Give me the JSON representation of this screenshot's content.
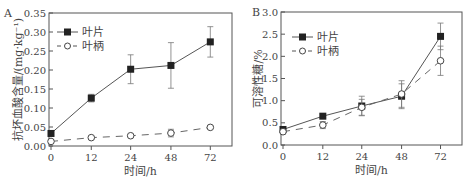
{
  "chart_data": [
    {
      "type": "line",
      "panel": "A",
      "title": "",
      "xlabel": "时间/h",
      "ylabel": "抗坏血酸含量/(mg·kg⁻¹)",
      "categories": [
        "0",
        "12",
        "24",
        "48",
        "72"
      ],
      "ylim": [
        0,
        0.35
      ],
      "yticks": [
        "0.00",
        "0.05",
        "0.10",
        "0.15",
        "0.20",
        "0.25",
        "0.30",
        "0.35"
      ],
      "legend_position": "upper-left",
      "series": [
        {
          "name": "叶片",
          "style": "solid-filled-square",
          "values": [
            0.033,
            0.126,
            0.202,
            0.212,
            0.274
          ],
          "errors": [
            0.004,
            0.01,
            0.038,
            0.06,
            0.04
          ]
        },
        {
          "name": "叶柄",
          "style": "dashed-open-circle",
          "values": [
            0.012,
            0.022,
            0.027,
            0.034,
            0.049
          ],
          "errors": [
            0.003,
            0.003,
            0.003,
            0.01,
            0.003
          ]
        }
      ]
    },
    {
      "type": "line",
      "panel": "B",
      "title": "",
      "xlabel": "时间/h",
      "ylabel": "可溶性糖/%",
      "categories": [
        "0",
        "12",
        "24",
        "48",
        "72"
      ],
      "ylim": [
        0,
        3.0
      ],
      "yticks": [
        "0.0",
        "0.5",
        "1.0",
        "1.5",
        "2.0",
        "2.5",
        "3.0"
      ],
      "legend_position": "upper-left",
      "series": [
        {
          "name": "叶片",
          "style": "solid-filled-square",
          "values": [
            0.35,
            0.65,
            0.88,
            1.1,
            2.45
          ],
          "errors": [
            0.05,
            0.05,
            0.22,
            0.28,
            0.3
          ]
        },
        {
          "name": "叶柄",
          "style": "dashed-open-circle",
          "values": [
            0.3,
            0.45,
            0.85,
            1.15,
            1.9
          ],
          "errors": [
            0.05,
            0.08,
            0.18,
            0.3,
            0.33
          ]
        }
      ]
    }
  ]
}
